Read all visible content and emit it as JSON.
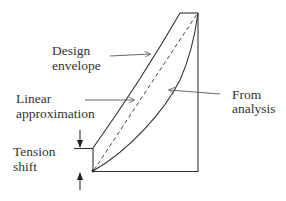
{
  "diagram": {
    "type": "moment-envelope-tension-shift",
    "colors": {
      "line": "#333333",
      "text": "#333333",
      "background": "#ffffff"
    },
    "labels": {
      "design_envelope": [
        "Design",
        "envelope"
      ],
      "linear_approximation": [
        "Linear",
        "approximation"
      ],
      "from_analysis": [
        "From",
        "analysis"
      ],
      "tension_shift": [
        "Tension",
        "shift"
      ]
    },
    "elements": {
      "outline_box": "Right vertical and bottom horizontal boundary lines",
      "design_envelope_line": "Solid line from top of tension shift to top-left corner",
      "linear_approximation_line": "Dashed straight line from origin to top-right corner",
      "analysis_curve": "Solid concave curve from origin to top-right corner",
      "tension_shift_dimension": "Vertical offset marked with two opposing arrows"
    }
  }
}
